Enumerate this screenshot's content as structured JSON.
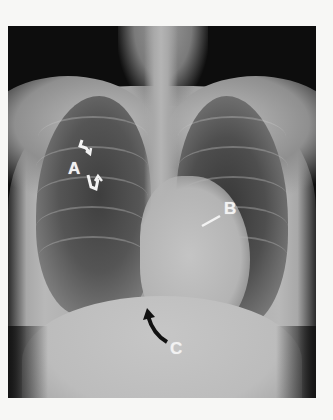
{
  "image": {
    "subject": "Chest X-ray, frontal view",
    "background_color": "#f7f7f5",
    "film_color": "#0d0d0d"
  },
  "annotations": [
    {
      "id": "A",
      "label": "A",
      "marker": "curved double arrows (white)",
      "position": "right upper lung field"
    },
    {
      "id": "B",
      "label": "B",
      "marker": "straight arrow (white)",
      "position": "left heart border"
    },
    {
      "id": "C",
      "label": "C",
      "marker": "curved arrow (black)",
      "position": "below heart / diaphragm"
    }
  ]
}
